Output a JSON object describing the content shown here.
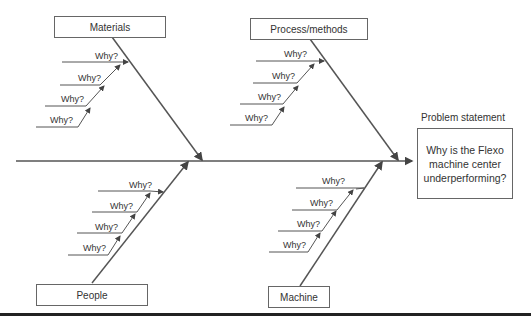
{
  "diagram": {
    "type": "fishbone",
    "categories": {
      "materials": "Materials",
      "process": "Process/methods",
      "people": "People",
      "machine": "Machine"
    },
    "why_label": "Why?",
    "problem_statement_label": "Problem statement",
    "problem_lines": [
      "Why is the Flexo",
      "machine center",
      "underperforming?"
    ]
  }
}
